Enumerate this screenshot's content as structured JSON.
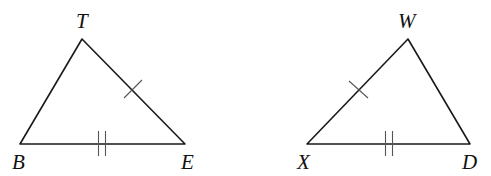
{
  "diagram": {
    "type": "congruent-triangles",
    "colors": {
      "line": "#1a1a1a",
      "tick": "#555555",
      "label": "#111111",
      "background": "#ffffff"
    },
    "triangles": [
      {
        "name": "triangle-TBE",
        "vertices": {
          "apex": {
            "label": "T",
            "x": 82,
            "y": 39
          },
          "left": {
            "label": "B",
            "x": 20,
            "y": 144
          },
          "right": {
            "label": "E",
            "x": 185,
            "y": 144
          }
        },
        "labels": {
          "T": {
            "text": "T",
            "x": 76,
            "y": 28
          },
          "B": {
            "text": "B",
            "x": 12,
            "y": 169
          },
          "E": {
            "text": "E",
            "x": 181,
            "y": 169
          }
        },
        "marks": [
          {
            "side": "TE",
            "ticks": 1
          },
          {
            "side": "BE",
            "ticks": 2
          }
        ]
      },
      {
        "name": "triangle-WXD",
        "vertices": {
          "apex": {
            "label": "W",
            "x": 408,
            "y": 39
          },
          "left": {
            "label": "X",
            "x": 307,
            "y": 144
          },
          "right": {
            "label": "D",
            "x": 470,
            "y": 144
          }
        },
        "labels": {
          "W": {
            "text": "W",
            "x": 398,
            "y": 28
          },
          "X": {
            "text": "X",
            "x": 297,
            "y": 169
          },
          "D": {
            "text": "D",
            "x": 462,
            "y": 169
          }
        },
        "marks": [
          {
            "side": "WX",
            "ticks": 1
          },
          {
            "side": "XD",
            "ticks": 2
          }
        ]
      }
    ]
  }
}
